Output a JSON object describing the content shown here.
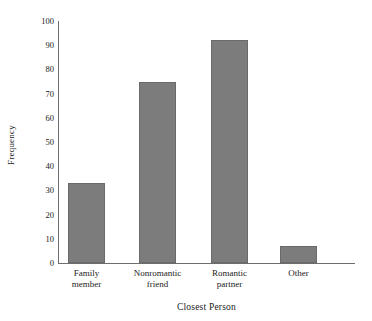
{
  "chart_data": {
    "type": "bar",
    "title": "",
    "xlabel": "Closest Person",
    "ylabel": "Frequency",
    "categories": [
      "Family\nmember",
      "Nonromantic\nfriend",
      "Romantic\npartner",
      "Other"
    ],
    "values": [
      33,
      75,
      92,
      7
    ],
    "ylim": [
      0,
      100
    ],
    "yticks": [
      0,
      10,
      20,
      30,
      40,
      50,
      60,
      70,
      80,
      90,
      100
    ],
    "ytick_labels": [
      "0",
      "10",
      "20",
      "30",
      "40",
      "50",
      "60",
      "70",
      "80",
      "90",
      "100"
    ],
    "grid": false,
    "legend": null,
    "bar_color": "#7c7c7c",
    "bar_edge_color": "#6a6a6a",
    "axis_color": "#6d6d6d"
  },
  "figure": {
    "title_sliver": "",
    "background": "#ffffff"
  }
}
